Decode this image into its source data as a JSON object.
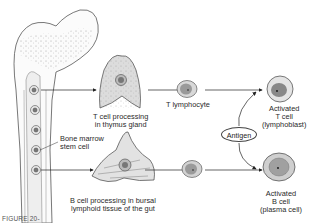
{
  "diagram": {
    "type": "flow",
    "nodes": {
      "bone_marrow": {
        "label": "Bone marrow\nstem cell",
        "line1": "Bone marrow",
        "line2": "stem cell"
      },
      "thymus": {
        "line1": "T cell processing",
        "line2": "in thymus gland"
      },
      "t_lymphocyte": {
        "label": "T lymphocyte"
      },
      "activated_t": {
        "line1": "Activated",
        "line2": "T cell",
        "line3": "(lymphoblast)"
      },
      "bursal": {
        "line1": "B cell processing in bursal",
        "line2": "lymphoid tissue of the gut"
      },
      "activated_b": {
        "line1": "Activated",
        "line2": "B cell",
        "line3": "(plasma cell)"
      },
      "antigen": {
        "label": "Antigen"
      }
    },
    "edges": [
      {
        "from": "bone_marrow",
        "to": "thymus"
      },
      {
        "from": "thymus",
        "to": "t_lymphocyte"
      },
      {
        "from": "t_lymphocyte",
        "to": "activated_t"
      },
      {
        "from": "antigen",
        "to": "activated_t"
      },
      {
        "from": "bone_marrow",
        "to": "bursal"
      },
      {
        "from": "bursal",
        "to": "b_lymphocyte"
      },
      {
        "from": "b_lymphocyte",
        "to": "activated_b"
      },
      {
        "from": "antigen",
        "to": "activated_b"
      }
    ],
    "caption": "FIGURE 20-"
  },
  "colors": {
    "line": "#333333",
    "cell_fill": "#cfcfcf",
    "nucleus": "#8a8a8a",
    "bone_outline": "#555555"
  }
}
